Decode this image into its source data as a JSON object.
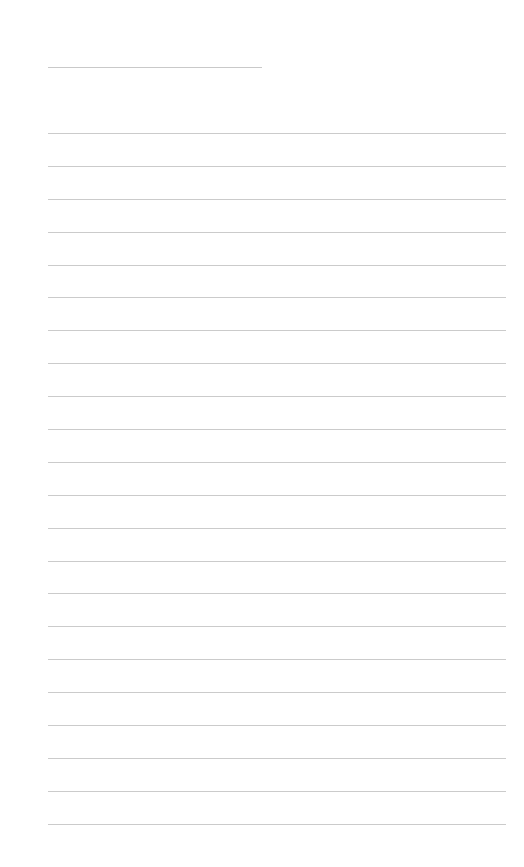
{
  "document": {
    "type": "lined-notepaper",
    "title": "",
    "line_color": "#cbcbcb",
    "background": "#ffffff",
    "line_count": 22,
    "lines": [
      "",
      "",
      "",
      "",
      "",
      "",
      "",
      "",
      "",
      "",
      "",
      "",
      "",
      "",
      "",
      "",
      "",
      "",
      "",
      "",
      "",
      ""
    ]
  }
}
